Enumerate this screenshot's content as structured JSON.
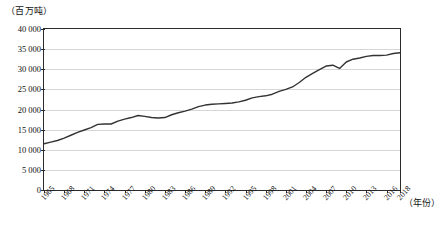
{
  "chart_data": {
    "type": "line",
    "title": "",
    "subtitle": "",
    "unit_label": "（百万吨）",
    "xlabel": "（年份）",
    "ylabel": "",
    "ylim": [
      0,
      40000
    ],
    "xlim": [
      1965,
      2018
    ],
    "grid": true,
    "legend": false,
    "yticks": [
      "0",
      "5 000",
      "10 000",
      "15 000",
      "20 000",
      "25 000",
      "30 000",
      "35 000",
      "40 000"
    ],
    "ytick_values": [
      0,
      5000,
      10000,
      15000,
      20000,
      25000,
      30000,
      35000,
      40000
    ],
    "xticks": [
      "1965",
      "1968",
      "1971",
      "1974",
      "1977",
      "1980",
      "1983",
      "1986",
      "1989",
      "1992",
      "1995",
      "1998",
      "2001",
      "2004",
      "2007",
      "2010",
      "2013",
      "2016",
      "2018"
    ],
    "xtick_values": [
      1965,
      1968,
      1971,
      1974,
      1977,
      1980,
      1983,
      1986,
      1989,
      1992,
      1995,
      1998,
      2001,
      2004,
      2007,
      2010,
      2013,
      2016,
      2018
    ],
    "line_color": "#333333",
    "x": [
      1965,
      1966,
      1967,
      1968,
      1969,
      1970,
      1971,
      1972,
      1973,
      1974,
      1975,
      1976,
      1977,
      1978,
      1979,
      1980,
      1981,
      1982,
      1983,
      1984,
      1985,
      1986,
      1987,
      1988,
      1989,
      1990,
      1991,
      1992,
      1993,
      1994,
      1995,
      1996,
      1997,
      1998,
      1999,
      2000,
      2001,
      2002,
      2003,
      2004,
      2005,
      2006,
      2007,
      2008,
      2009,
      2010,
      2011,
      2012,
      2013,
      2014,
      2015,
      2016,
      2017,
      2018
    ],
    "values": [
      11500,
      11900,
      12300,
      12900,
      13600,
      14300,
      14900,
      15500,
      16300,
      16400,
      16400,
      17100,
      17600,
      18000,
      18500,
      18300,
      18000,
      17900,
      18000,
      18700,
      19200,
      19600,
      20100,
      20700,
      21100,
      21300,
      21400,
      21500,
      21600,
      21900,
      22300,
      22900,
      23200,
      23400,
      23800,
      24500,
      25000,
      25600,
      26700,
      28000,
      29000,
      29900,
      30800,
      31000,
      30200,
      31800,
      32500,
      32800,
      33200,
      33400,
      33400,
      33500,
      33900,
      34100
    ],
    "series_name": "消费量"
  }
}
